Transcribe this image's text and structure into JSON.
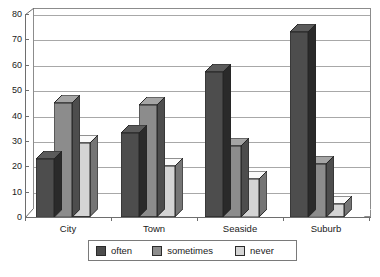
{
  "chart_data": {
    "type": "bar",
    "title": "",
    "subtitle": "",
    "xlabel": "",
    "ylabel": "",
    "ylim": [
      0,
      80
    ],
    "yticks": [
      0,
      10,
      20,
      30,
      40,
      50,
      60,
      70,
      80
    ],
    "grid": true,
    "grid_axis": "y",
    "legend_position": "bottom",
    "style": "3d-grouped-bar",
    "categories": [
      "City",
      "Town",
      "Seaside",
      "Suburb"
    ],
    "series": [
      {
        "name": "often",
        "color": "#4d4d4d",
        "values": [
          23,
          33,
          57,
          73
        ]
      },
      {
        "name": "sometimes",
        "color": "#8c8c8c",
        "values": [
          45,
          44,
          28,
          21
        ]
      },
      {
        "name": "never",
        "color": "#d4d4d4",
        "values": [
          29,
          20,
          15,
          5
        ]
      }
    ]
  },
  "legend": {
    "items": [
      {
        "label": "often"
      },
      {
        "label": "sometimes"
      },
      {
        "label": "never"
      }
    ]
  },
  "axis": {
    "y_tick_labels": [
      "80",
      "70",
      "60",
      "50",
      "40",
      "30",
      "20",
      "10",
      "0"
    ],
    "x_tick_labels": [
      "City",
      "Town",
      "Seaside",
      "Suburb"
    ]
  },
  "colors": {
    "series_often": "#4d4d4d",
    "series_sometimes": "#8c8c8c",
    "series_never": "#d4d4d4",
    "grid": "#a8a8a8",
    "axis": "#6e6e6e",
    "text": "#1a1a1a",
    "background": "#ffffff"
  }
}
